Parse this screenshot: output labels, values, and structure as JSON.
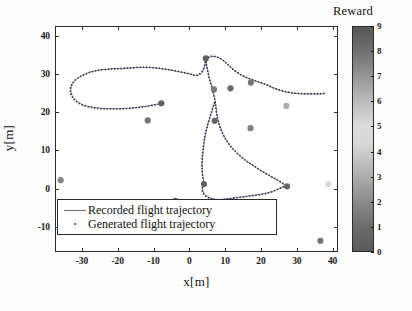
{
  "chart_data": {
    "type": "scatter",
    "title": "",
    "xlabel": "x[m]",
    "ylabel": "y[m]",
    "xlim": [
      -37.5,
      41.5
    ],
    "ylim": [
      -16.5,
      42.5
    ],
    "xticks": [
      -30,
      -20,
      -10,
      0,
      10,
      20,
      30,
      40
    ],
    "yticks": [
      -10,
      0,
      10,
      20,
      30,
      40
    ],
    "grid": false,
    "legend": [
      {
        "label": "Recorded flight trajectory",
        "marker": "line",
        "color": "#6f6f84"
      },
      {
        "label": "Generated flight trajectory",
        "marker": "dot",
        "color": "#303045"
      }
    ],
    "colorbar": {
      "title": "Reward",
      "ticks": [
        0,
        1,
        2,
        3,
        4,
        5,
        6,
        7,
        8,
        9
      ],
      "vmin": 0,
      "vmax": 9,
      "orientation": "vertical",
      "colormap": "grayscale-jet",
      "stops": [
        {
          "pos": 0.0,
          "color": "#5a5a5a"
        },
        {
          "pos": 0.1,
          "color": "#6a6a6a"
        },
        {
          "pos": 0.22,
          "color": "#8a8a8a"
        },
        {
          "pos": 0.35,
          "color": "#b2b2b2"
        },
        {
          "pos": 0.48,
          "color": "#d8d8d8"
        },
        {
          "pos": 0.56,
          "color": "#dcdcdc"
        },
        {
          "pos": 0.68,
          "color": "#b8b8b8"
        },
        {
          "pos": 0.8,
          "color": "#8e8e8e"
        },
        {
          "pos": 0.9,
          "color": "#6e6e6e"
        },
        {
          "pos": 1.0,
          "color": "#565656"
        }
      ]
    },
    "series": [
      {
        "name": "Recorded flight trajectory",
        "style": "line",
        "color": "#7b7b90",
        "points": [
          [
            -8.0,
            22.6
          ],
          [
            -10.2,
            22.2
          ],
          [
            -12.6,
            21.8
          ],
          [
            -15.0,
            21.5
          ],
          [
            -17.6,
            21.3
          ],
          [
            -20.2,
            21.2
          ],
          [
            -22.8,
            21.2
          ],
          [
            -25.2,
            21.3
          ],
          [
            -27.4,
            21.6
          ],
          [
            -29.4,
            22.0
          ],
          [
            -31.2,
            22.8
          ],
          [
            -32.6,
            24.0
          ],
          [
            -33.3,
            25.5
          ],
          [
            -33.2,
            27.0
          ],
          [
            -32.4,
            28.3
          ],
          [
            -31.0,
            29.4
          ],
          [
            -29.2,
            30.3
          ],
          [
            -27.0,
            31.0
          ],
          [
            -24.6,
            31.4
          ],
          [
            -22.0,
            31.6
          ],
          [
            -19.4,
            31.7
          ],
          [
            -16.8,
            31.8
          ],
          [
            -14.2,
            31.9
          ],
          [
            -11.6,
            31.9
          ],
          [
            -9.0,
            31.7
          ],
          [
            -6.6,
            31.4
          ],
          [
            -4.2,
            31.0
          ],
          [
            -2.0,
            30.6
          ],
          [
            0.0,
            30.2
          ],
          [
            1.8,
            29.8
          ],
          [
            3.2,
            30.5
          ],
          [
            3.9,
            31.8
          ],
          [
            4.2,
            33.0
          ],
          [
            4.6,
            34.0
          ],
          [
            5.4,
            34.6
          ],
          [
            6.6,
            34.8
          ],
          [
            8.0,
            34.4
          ],
          [
            9.4,
            33.6
          ],
          [
            10.8,
            32.4
          ],
          [
            12.2,
            31.2
          ],
          [
            13.8,
            30.2
          ],
          [
            15.4,
            29.4
          ],
          [
            17.0,
            28.8
          ],
          [
            18.8,
            28.2
          ],
          [
            20.6,
            27.6
          ],
          [
            22.4,
            26.9
          ],
          [
            24.2,
            26.2
          ],
          [
            26.0,
            25.7
          ],
          [
            28.0,
            25.3
          ],
          [
            30.0,
            25.1
          ],
          [
            32.0,
            25.0
          ],
          [
            34.0,
            25.0
          ],
          [
            36.0,
            25.0
          ],
          [
            37.6,
            25.1
          ]
        ]
      },
      {
        "name": "Recorded flight trajectory (descending loop)",
        "style": "line",
        "color": "#7b7b90",
        "points": [
          [
            4.4,
            34.2
          ],
          [
            4.6,
            32.4
          ],
          [
            5.0,
            30.6
          ],
          [
            5.4,
            28.8
          ],
          [
            6.0,
            27.0
          ],
          [
            6.5,
            25.2
          ],
          [
            6.9,
            23.4
          ],
          [
            7.2,
            21.6
          ],
          [
            7.4,
            19.8
          ],
          [
            7.8,
            18.0
          ],
          [
            8.4,
            16.2
          ],
          [
            9.2,
            14.4
          ],
          [
            10.2,
            12.8
          ],
          [
            11.4,
            11.2
          ],
          [
            12.8,
            9.8
          ],
          [
            14.2,
            8.6
          ],
          [
            15.8,
            7.4
          ],
          [
            17.4,
            6.4
          ],
          [
            19.0,
            5.4
          ],
          [
            20.6,
            4.5
          ],
          [
            22.2,
            3.6
          ],
          [
            23.8,
            2.8
          ],
          [
            25.2,
            2.0
          ],
          [
            26.2,
            1.4
          ],
          [
            26.9,
            1.0
          ]
        ]
      },
      {
        "name": "Recorded flight trajectory (lower arc)",
        "style": "line",
        "color": "#7b7b90",
        "points": [
          [
            3.8,
            1.4
          ],
          [
            3.4,
            0.4
          ],
          [
            3.6,
            -0.6
          ],
          [
            4.2,
            -1.4
          ],
          [
            5.2,
            -2.0
          ],
          [
            6.6,
            -2.4
          ],
          [
            8.2,
            -2.5
          ],
          [
            9.8,
            -2.4
          ],
          [
            11.4,
            -2.2
          ],
          [
            13.0,
            -2.0
          ],
          [
            14.6,
            -1.8
          ],
          [
            16.2,
            -1.6
          ],
          [
            17.8,
            -1.4
          ],
          [
            19.4,
            -1.2
          ],
          [
            21.0,
            -0.9
          ],
          [
            22.6,
            -0.5
          ],
          [
            24.0,
            0.0
          ],
          [
            25.2,
            0.5
          ],
          [
            26.2,
            0.9
          ],
          [
            26.9,
            1.1
          ]
        ]
      },
      {
        "name": "Recorded flight trajectory (left descent)",
        "style": "line",
        "color": "#7b7b90",
        "points": [
          [
            6.8,
            22.8
          ],
          [
            6.2,
            21.0
          ],
          [
            5.6,
            19.2
          ],
          [
            5.0,
            17.4
          ],
          [
            4.5,
            15.6
          ],
          [
            4.1,
            13.8
          ],
          [
            3.8,
            12.0
          ],
          [
            3.6,
            10.2
          ],
          [
            3.4,
            8.4
          ],
          [
            3.3,
            6.6
          ],
          [
            3.4,
            4.8
          ],
          [
            3.6,
            3.0
          ],
          [
            3.8,
            1.6
          ]
        ]
      },
      {
        "name": "Generated flight trajectory",
        "style": "dots",
        "color": "#2e2e44",
        "points": [
          [
            -8.1,
            22.5
          ],
          [
            -10.3,
            22.1
          ],
          [
            -12.7,
            21.7
          ],
          [
            -15.1,
            21.4
          ],
          [
            -17.7,
            21.2
          ],
          [
            -20.3,
            21.1
          ],
          [
            -22.9,
            21.1
          ],
          [
            -25.3,
            21.2
          ],
          [
            -27.5,
            21.5
          ],
          [
            -29.5,
            21.9
          ],
          [
            -31.3,
            22.7
          ],
          [
            -32.7,
            23.9
          ],
          [
            -33.5,
            25.4
          ],
          [
            -33.4,
            26.9
          ],
          [
            -32.6,
            28.2
          ],
          [
            -31.2,
            29.3
          ],
          [
            -29.4,
            30.2
          ],
          [
            -27.2,
            30.9
          ],
          [
            -24.8,
            31.3
          ],
          [
            -22.2,
            31.5
          ],
          [
            -19.6,
            31.6
          ],
          [
            -17.0,
            31.8
          ],
          [
            -14.4,
            32.0
          ],
          [
            -11.8,
            32.0
          ],
          [
            -9.2,
            31.8
          ],
          [
            -6.8,
            31.5
          ],
          [
            -4.4,
            31.1
          ],
          [
            -2.2,
            30.7
          ],
          [
            -0.2,
            30.3
          ],
          [
            1.6,
            29.9
          ],
          [
            3.0,
            30.6
          ],
          [
            3.8,
            31.9
          ],
          [
            4.1,
            33.1
          ],
          [
            4.5,
            34.1
          ],
          [
            5.3,
            34.7
          ],
          [
            6.5,
            34.9
          ],
          [
            7.9,
            34.5
          ],
          [
            9.3,
            33.7
          ],
          [
            10.7,
            32.5
          ],
          [
            12.1,
            31.3
          ],
          [
            13.7,
            30.3
          ],
          [
            15.3,
            29.5
          ],
          [
            16.9,
            28.9
          ],
          [
            18.7,
            28.3
          ],
          [
            20.5,
            27.7
          ],
          [
            22.3,
            27.0
          ],
          [
            24.1,
            26.3
          ],
          [
            25.9,
            25.8
          ],
          [
            27.9,
            25.4
          ],
          [
            29.9,
            25.2
          ],
          [
            31.9,
            25.1
          ],
          [
            33.9,
            25.1
          ],
          [
            35.9,
            25.1
          ],
          [
            37.5,
            25.2
          ]
        ]
      },
      {
        "name": "Generated flight trajectory (descending loop)",
        "style": "dots",
        "color": "#2e2e44",
        "points": [
          [
            4.3,
            34.3
          ],
          [
            4.5,
            32.5
          ],
          [
            4.9,
            30.7
          ],
          [
            5.3,
            28.9
          ],
          [
            5.9,
            27.1
          ],
          [
            6.4,
            25.3
          ],
          [
            6.8,
            23.5
          ],
          [
            7.1,
            21.7
          ],
          [
            7.3,
            19.9
          ],
          [
            7.7,
            18.1
          ],
          [
            8.3,
            16.3
          ],
          [
            9.1,
            14.5
          ],
          [
            10.1,
            12.9
          ],
          [
            11.3,
            11.3
          ],
          [
            12.7,
            9.9
          ],
          [
            14.1,
            8.7
          ],
          [
            15.7,
            7.5
          ],
          [
            17.3,
            6.5
          ],
          [
            18.9,
            5.5
          ],
          [
            20.5,
            4.6
          ],
          [
            22.1,
            3.7
          ],
          [
            23.7,
            2.9
          ],
          [
            25.1,
            2.1
          ],
          [
            26.1,
            1.5
          ],
          [
            26.8,
            1.1
          ]
        ]
      },
      {
        "name": "Generated flight trajectory (lower arc)",
        "style": "dots",
        "color": "#2e2e44",
        "points": [
          [
            3.7,
            1.3
          ],
          [
            3.3,
            0.3
          ],
          [
            3.5,
            -0.7
          ],
          [
            4.1,
            -1.5
          ],
          [
            5.1,
            -2.1
          ],
          [
            6.5,
            -2.5
          ],
          [
            8.1,
            -2.6
          ],
          [
            9.7,
            -2.5
          ],
          [
            11.3,
            -2.3
          ],
          [
            12.9,
            -2.1
          ],
          [
            14.5,
            -1.9
          ],
          [
            16.1,
            -1.7
          ],
          [
            17.7,
            -1.5
          ],
          [
            19.3,
            -1.3
          ],
          [
            20.9,
            -1.0
          ],
          [
            22.5,
            -0.6
          ],
          [
            23.9,
            -0.1
          ],
          [
            25.1,
            0.4
          ],
          [
            26.1,
            0.8
          ],
          [
            26.8,
            1.0
          ]
        ]
      },
      {
        "name": "Generated flight trajectory (left descent)",
        "style": "dots",
        "color": "#2e2e44",
        "points": [
          [
            6.7,
            22.7
          ],
          [
            6.1,
            20.9
          ],
          [
            5.5,
            19.1
          ],
          [
            4.9,
            17.3
          ],
          [
            4.4,
            15.5
          ],
          [
            4.0,
            13.7
          ],
          [
            3.7,
            11.9
          ],
          [
            3.5,
            10.1
          ],
          [
            3.3,
            8.3
          ],
          [
            3.2,
            6.5
          ],
          [
            3.3,
            4.7
          ],
          [
            3.5,
            2.9
          ],
          [
            3.7,
            1.5
          ]
        ]
      }
    ],
    "waypoints": [
      {
        "x": -36.2,
        "y": 2.5,
        "reward": 7.4
      },
      {
        "x": -17.6,
        "y": -3.3,
        "reward": 2.2
      },
      {
        "x": -11.9,
        "y": 18.1,
        "reward": 7.9
      },
      {
        "x": -8.1,
        "y": 22.6,
        "reward": 8.6
      },
      {
        "x": -4.2,
        "y": -2.9,
        "reward": 8.2
      },
      {
        "x": 3.8,
        "y": 1.5,
        "reward": 8.5
      },
      {
        "x": 4.3,
        "y": 34.3,
        "reward": 8.6
      },
      {
        "x": 6.8,
        "y": 18.0,
        "reward": 8.4
      },
      {
        "x": 6.6,
        "y": 26.2,
        "reward": 7.8
      },
      {
        "x": 11.2,
        "y": 26.5,
        "reward": 8.3
      },
      {
        "x": 16.8,
        "y": 16.1,
        "reward": 7.6
      },
      {
        "x": 16.9,
        "y": 28.0,
        "reward": 7.9
      },
      {
        "x": 26.8,
        "y": 21.9,
        "reward": 3.0
      },
      {
        "x": 27.0,
        "y": 0.9,
        "reward": 8.4
      },
      {
        "x": 36.3,
        "y": -13.3,
        "reward": 8.0
      },
      {
        "x": 38.5,
        "y": 1.5,
        "reward": 4.5
      }
    ]
  }
}
